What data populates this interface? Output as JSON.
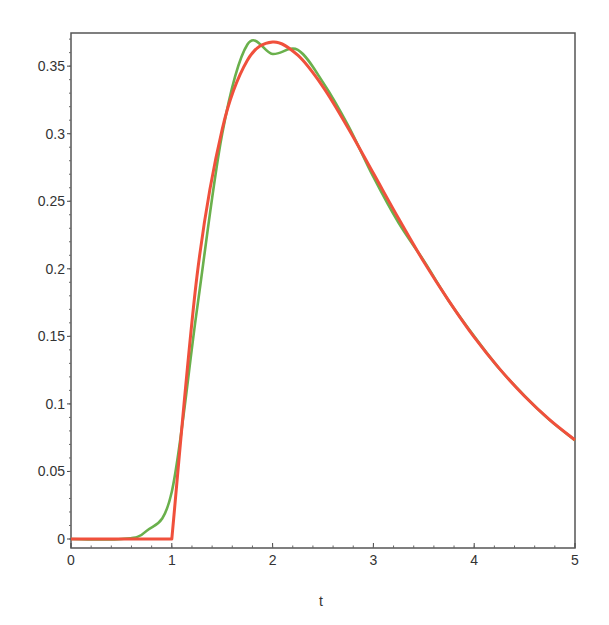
{
  "chart_data": {
    "type": "line",
    "title": "",
    "xlabel": "t",
    "ylabel": "",
    "xlim": [
      0,
      5
    ],
    "ylim": [
      -0.007,
      0.375
    ],
    "grid": false,
    "legend": null,
    "x_ticks": [
      "0",
      "1",
      "2",
      "3",
      "4",
      "5"
    ],
    "y_ticks": [
      "0",
      "0.05",
      "0.1",
      "0.15",
      "0.2",
      "0.25",
      "0.3",
      "0.35"
    ],
    "x": [
      0,
      0.5,
      0.75,
      1.0,
      1.25,
      1.5,
      1.75,
      2.0,
      2.25,
      2.5,
      2.75,
      3.0,
      3.25,
      3.5,
      3.75,
      4.0,
      4.25,
      4.5,
      4.75,
      5.0
    ],
    "series": [
      {
        "name": "approximation",
        "color": "#6ab04c",
        "values": [
          0,
          0.0,
          0.006,
          0.035,
          0.17,
          0.3,
          0.366,
          0.359,
          0.362,
          0.338,
          0.306,
          0.268,
          0.234,
          0.206,
          0.176,
          0.15,
          0.126,
          0.106,
          0.088,
          0.073
        ]
      },
      {
        "name": "exact",
        "color": "#f0503c",
        "values": [
          0,
          0,
          0,
          0,
          0.1947,
          0.3033,
          0.3543,
          0.3679,
          0.3581,
          0.3347,
          0.3041,
          0.2707,
          0.2372,
          0.2052,
          0.1761,
          0.1494,
          0.1261,
          0.1057,
          0.0882,
          0.0733
        ]
      }
    ]
  },
  "axes": {
    "x_title": "t",
    "x_tick_labels": [
      "0",
      "1",
      "2",
      "3",
      "4",
      "5"
    ],
    "y_tick_labels": [
      "0",
      "0.05",
      "0.1",
      "0.15",
      "0.2",
      "0.25",
      "0.3",
      "0.35"
    ]
  }
}
